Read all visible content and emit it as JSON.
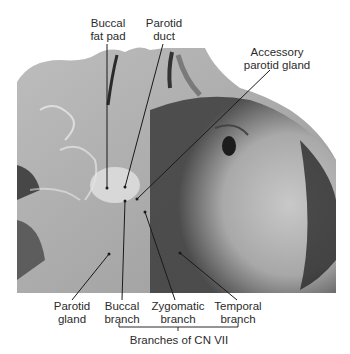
{
  "figure": {
    "colors": {
      "label_text": "#2b2b2b",
      "leader_line": "#1a1a1a",
      "background": "#ffffff"
    }
  },
  "labels": {
    "buccal_fat_pad": "Buccal\nfat pad",
    "parotid_duct": "Parotid\nduct",
    "accessory_parotid_gland": "Accessory\nparotid gland",
    "parotid_gland": "Parotid\ngland",
    "buccal_branch": "Buccal\nbranch",
    "zygomatic_branch": "Zygomatic\nbranch",
    "temporal_branch": "Temporal\nbranch",
    "group_bracket": "Branches of CN VII"
  }
}
